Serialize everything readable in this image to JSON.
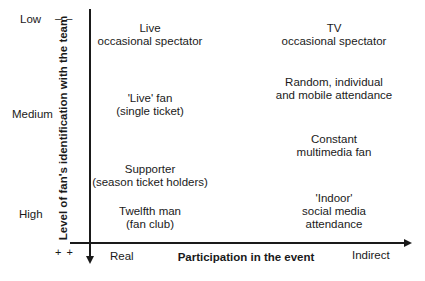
{
  "y_axis": {
    "label": "Level of fan's identification with the team",
    "levels": [
      "Low",
      "Medium",
      "High"
    ],
    "top_marker": "– –",
    "bottom_marker": "+ +"
  },
  "x_axis": {
    "label": "Participation in the event",
    "left_end": "Real",
    "right_end": "Indirect"
  },
  "cells": {
    "live_occasional": [
      "Live",
      "occasional spectator"
    ],
    "tv_occasional": [
      "TV",
      "occasional spectator"
    ],
    "live_fan": [
      "'Live' fan",
      "(single ticket)"
    ],
    "random_attendance": [
      "Random, individual",
      "and mobile attendance"
    ],
    "constant_fan": [
      "Constant",
      "multimedia fan"
    ],
    "supporter": [
      "Supporter",
      "(season ticket holders)"
    ],
    "twelfth_man": [
      "Twelfth man",
      "(fan club)"
    ],
    "indoor": [
      "'Indoor'",
      "social media",
      "attendance"
    ]
  },
  "colors": {
    "ink": "#1a1a1a",
    "background": "#ffffff"
  }
}
